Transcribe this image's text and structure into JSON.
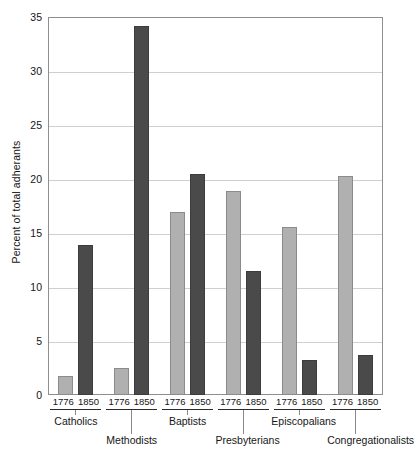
{
  "chart_data": {
    "type": "bar",
    "title": "",
    "subtitle": "",
    "xlabel": "",
    "ylabel": "Percent of total adherants",
    "ylim": [
      0,
      35
    ],
    "ytick_step": 5,
    "yticks": [
      "35",
      "30",
      "25",
      "20",
      "15",
      "10",
      "5",
      "0"
    ],
    "grid": "horizontal",
    "legend": "none",
    "categories": [
      "Catholics",
      "Methodists",
      "Baptists",
      "Presbyterians",
      "Episcopalians",
      "Congregationalists"
    ],
    "series": [
      {
        "name": "1776",
        "color": "#b0b0b0",
        "values": [
          1.8,
          2.5,
          16.9,
          18.9,
          15.6,
          20.3
        ]
      },
      {
        "name": "1850",
        "color": "#4a4a4a",
        "values": [
          13.9,
          34.2,
          20.5,
          11.5,
          3.2,
          3.7
        ]
      }
    ],
    "group_year_labels": [
      "1776",
      "1850"
    ],
    "colors": {
      "bar_1776": "#b0b0b0",
      "bar_1776_border": "#8b8b8b",
      "bar_1850": "#4a4a4a",
      "bar_1850_border": "#3c3c3c",
      "gridline": "#cfcfcf",
      "frame": "#8e8e8e",
      "text": "#161616",
      "background": "#ffffff"
    },
    "group_label_offsets": [
      0,
      1,
      0,
      1,
      0,
      1
    ]
  }
}
